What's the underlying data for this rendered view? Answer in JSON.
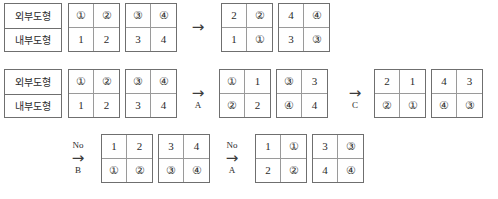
{
  "diagram": {
    "title_visible": false,
    "row_labels": {
      "outer": "외부도형",
      "inner": "내부도형"
    },
    "arrow_glyph": "→",
    "rows": [
      {
        "id": "row-1",
        "label_box": {
          "top": "외부도형",
          "bottom": "내부도형"
        },
        "items": [
          {
            "kind": "grid",
            "id": "r1-g1",
            "cells": [
              "①",
              "②",
              "1",
              "2"
            ]
          },
          {
            "kind": "grid",
            "id": "r1-g2",
            "cells": [
              "③",
              "④",
              "3",
              "4"
            ]
          },
          {
            "kind": "arrow",
            "id": "r1-a1",
            "caption": "",
            "sublabel": ""
          },
          {
            "kind": "grid",
            "id": "r1-g3",
            "cells": [
              "2",
              "②",
              "1",
              "①"
            ]
          },
          {
            "kind": "grid",
            "id": "r1-g4",
            "cells": [
              "4",
              "④",
              "3",
              "③"
            ]
          }
        ]
      },
      {
        "id": "row-2",
        "label_box": {
          "top": "외부도형",
          "bottom": "내부도형"
        },
        "items": [
          {
            "kind": "grid",
            "id": "r2-g1",
            "cells": [
              "①",
              "②",
              "1",
              "2"
            ]
          },
          {
            "kind": "grid",
            "id": "r2-g2",
            "cells": [
              "③",
              "④",
              "3",
              "4"
            ]
          },
          {
            "kind": "arrow",
            "id": "r2-a1",
            "caption": "",
            "sublabel": "A"
          },
          {
            "kind": "grid",
            "id": "r2-g3",
            "cells": [
              "①",
              "1",
              "②",
              "2"
            ]
          },
          {
            "kind": "grid",
            "id": "r2-g4",
            "cells": [
              "③",
              "3",
              "④",
              "4"
            ]
          },
          {
            "kind": "arrow",
            "id": "r2-a2",
            "caption": "",
            "sublabel": "C"
          },
          {
            "kind": "grid",
            "id": "r2-g5",
            "cells": [
              "2",
              "1",
              "②",
              "①"
            ]
          },
          {
            "kind": "grid",
            "id": "r2-g6",
            "cells": [
              "4",
              "3",
              "④",
              "③"
            ]
          }
        ]
      },
      {
        "id": "row-3",
        "label_box": null,
        "items": [
          {
            "kind": "arrow",
            "id": "r3-a1",
            "caption": "No",
            "sublabel": "B"
          },
          {
            "kind": "grid",
            "id": "r3-g1",
            "cells": [
              "1",
              "2",
              "①",
              "②"
            ]
          },
          {
            "kind": "grid",
            "id": "r3-g2",
            "cells": [
              "3",
              "4",
              "③",
              "④"
            ]
          },
          {
            "kind": "arrow",
            "id": "r3-a2",
            "caption": "No",
            "sublabel": "A"
          },
          {
            "kind": "grid",
            "id": "r3-g3",
            "cells": [
              "1",
              "①",
              "2",
              "②"
            ]
          },
          {
            "kind": "grid",
            "id": "r3-g4",
            "cells": [
              "3",
              "③",
              "4",
              "④"
            ]
          }
        ]
      }
    ]
  },
  "layout": {
    "row1": {
      "label_box": {
        "x": 4,
        "y": 3,
        "w": 58,
        "h": 49
      },
      "grids": [
        {
          "x": 68,
          "y": 3,
          "w": 52,
          "h": 49
        },
        {
          "x": 125,
          "y": 3,
          "w": 52,
          "h": 49
        },
        {
          "x": 221,
          "y": 3,
          "w": 52,
          "h": 49
        },
        {
          "x": 278,
          "y": 3,
          "w": 52,
          "h": 49
        }
      ],
      "arrows": [
        {
          "x": 183,
          "y": 3,
          "h": 49
        }
      ]
    },
    "row2": {
      "label_box": {
        "x": 4,
        "y": 69,
        "w": 58,
        "h": 49
      },
      "grids": [
        {
          "x": 68,
          "y": 69,
          "w": 52,
          "h": 49
        },
        {
          "x": 125,
          "y": 69,
          "w": 52,
          "h": 49
        },
        {
          "x": 219,
          "y": 69,
          "w": 52,
          "h": 49
        },
        {
          "x": 276,
          "y": 69,
          "w": 52,
          "h": 49
        },
        {
          "x": 374,
          "y": 69,
          "w": 52,
          "h": 49
        },
        {
          "x": 431,
          "y": 69,
          "w": 52,
          "h": 49
        }
      ],
      "arrows": [
        {
          "x": 183,
          "y": 69,
          "h": 49
        },
        {
          "x": 340,
          "y": 69,
          "h": 49
        }
      ]
    },
    "row3": {
      "grids": [
        {
          "x": 101,
          "y": 134,
          "w": 52,
          "h": 49
        },
        {
          "x": 158,
          "y": 134,
          "w": 52,
          "h": 49
        },
        {
          "x": 255,
          "y": 134,
          "w": 52,
          "h": 49
        },
        {
          "x": 312,
          "y": 134,
          "w": 52,
          "h": 49
        }
      ],
      "arrows": [
        {
          "x": 63,
          "y": 134,
          "h": 49
        },
        {
          "x": 217,
          "y": 134,
          "h": 49
        }
      ]
    }
  }
}
